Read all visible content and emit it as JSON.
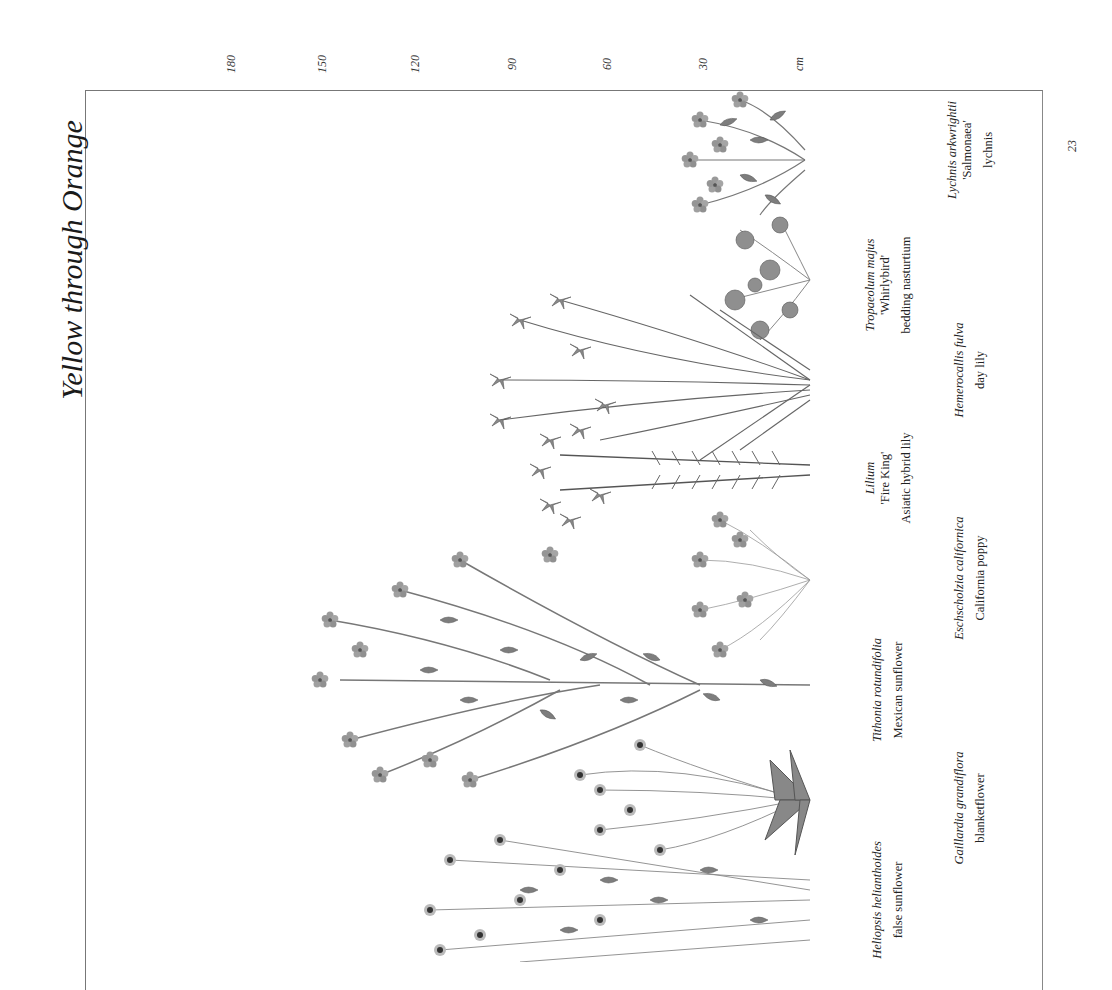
{
  "page": {
    "title": "Yellow through Orange",
    "page_number": "23",
    "frame_color": "#777777"
  },
  "scale": {
    "unit": "cm",
    "ticks": [
      {
        "label": "180",
        "x": 231
      },
      {
        "label": "150",
        "x": 322
      },
      {
        "label": "120",
        "x": 415
      },
      {
        "label": "90",
        "x": 512
      },
      {
        "label": "60",
        "x": 607
      },
      {
        "label": "30",
        "x": 703
      },
      {
        "label": "cm",
        "x": 799
      }
    ]
  },
  "plants": [
    {
      "scientific": "Lychnis arkwrightii",
      "cultivar": "'Salmonaea'",
      "common": "lychnis",
      "label_x": 970,
      "label_y": 150
    },
    {
      "scientific": "Tropaeolum majus",
      "cultivar": "'Whirlybird'",
      "common": "bedding nasturtium",
      "label_x": 888,
      "label_y": 285
    },
    {
      "scientific": "Hemerocallis fulva",
      "cultivar": "",
      "common": "day lily",
      "label_x": 970,
      "label_y": 370
    },
    {
      "scientific": "Lilium",
      "cultivar": "'Fire King'",
      "common": "Asiatic hybrid lily",
      "label_x": 888,
      "label_y": 478
    },
    {
      "scientific": "Eschscholzia californica",
      "cultivar": "",
      "common": "California poppy",
      "label_x": 970,
      "label_y": 578
    },
    {
      "scientific": "Tithonia rotundifolia",
      "cultivar": "",
      "common": "Mexican sunflower",
      "label_x": 888,
      "label_y": 690
    },
    {
      "scientific": "Gaillardia grandiflora",
      "cultivar": "",
      "common": "blanketflower",
      "label_x": 970,
      "label_y": 808
    },
    {
      "scientific": "Heliopsis helianthoides",
      "cultivar": "",
      "common": "false sunflower",
      "label_x": 888,
      "label_y": 900
    }
  ]
}
